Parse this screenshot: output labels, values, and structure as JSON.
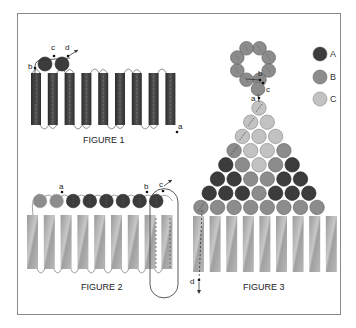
{
  "colors": {
    "A": "#3c3c3c",
    "B": "#8c8c8c",
    "C": "#c2c2c2",
    "frame": "#8a8a8a",
    "bar_dark": "#3a3a3a",
    "bar_grey": "#a9a9a9"
  },
  "legend": {
    "items": [
      {
        "key": "A",
        "label": "A"
      },
      {
        "key": "B",
        "label": "B"
      },
      {
        "key": "C",
        "label": "C"
      }
    ]
  },
  "figure1": {
    "caption": "FIGURE 1",
    "bars": 9,
    "circles": [
      "A",
      "A"
    ],
    "labels": {
      "a": "a",
      "b": "b",
      "c": "c",
      "d": "d"
    }
  },
  "figure2": {
    "caption": "FIGURE 2",
    "bars": 9,
    "circles": [
      "B",
      "B",
      "A",
      "A",
      "A",
      "A",
      "A",
      "A"
    ],
    "labels": {
      "a": "a",
      "b": "b",
      "c": "c"
    }
  },
  "figure3": {
    "caption": "FIGURE 3",
    "bars": 9,
    "loop_circles": 8,
    "loop_color": "B",
    "rows": [
      [
        "C"
      ],
      [
        "C",
        "C"
      ],
      [
        "C",
        "C",
        "C"
      ],
      [
        "B",
        "C",
        "C",
        "B"
      ],
      [
        "A",
        "B",
        "C",
        "B",
        "A"
      ],
      [
        "A",
        "A",
        "B",
        "B",
        "A",
        "A"
      ],
      [
        "A",
        "A",
        "A",
        "B",
        "A",
        "A",
        "A"
      ],
      [
        "B",
        "B",
        "B",
        "B",
        "B",
        "B",
        "B",
        "B"
      ]
    ],
    "labels": {
      "a": "a",
      "b": "b",
      "c": "c",
      "d": "d"
    }
  }
}
